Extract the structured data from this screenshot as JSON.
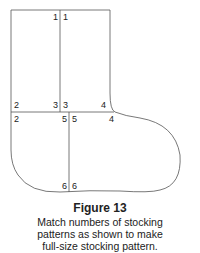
{
  "figure": {
    "title": "Figure 13",
    "caption_lines": [
      "Match numbers of stocking",
      "patterns as shown to make",
      "full-size stocking pattern."
    ]
  },
  "labels": {
    "top_left_1": "1",
    "top_right_1": "1",
    "mid_left_2": "2",
    "mid_left_3": "3",
    "mid_right_3": "3",
    "mid_right_4": "4",
    "low_left_2": "2",
    "low_left_5": "5",
    "low_right_5": "5",
    "low_right_4": "4",
    "bottom_left_6": "6",
    "bottom_right_6": "6"
  },
  "colors": {
    "line": "#555555",
    "text": "#222222"
  }
}
